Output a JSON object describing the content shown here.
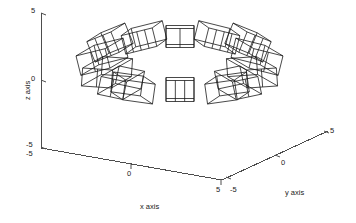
{
  "figure": {
    "type": "3d-line-plot",
    "background_color": "#ffffff",
    "line_color": "#1a1a1a",
    "axis_color": "#4d4d4d",
    "text_color": "#1a1a1a"
  },
  "axes": {
    "x": {
      "title": "x axis",
      "ticks": [
        "-5",
        "0",
        "5"
      ],
      "range": [
        -5,
        5
      ]
    },
    "y": {
      "title": "y axis",
      "ticks": [
        "-5",
        "0",
        "5"
      ],
      "range": [
        -5,
        5
      ]
    },
    "z": {
      "title": "z axis",
      "ticks": [
        "-5",
        "0",
        "5"
      ],
      "range": [
        -5,
        5
      ]
    }
  },
  "chart_data": {
    "type": "line",
    "title": "",
    "xlabel": "x axis",
    "ylabel": "y axis",
    "zlabel": "z axis",
    "xlim": [
      -5,
      5
    ],
    "ylim": [
      -5,
      5
    ],
    "zlim": [
      -5,
      5
    ],
    "grid": false,
    "legend": null,
    "series": [
      {
        "name": "wireframe-boxes",
        "count": 14,
        "boxes": [
          {
            "id": 1,
            "cluster": "left",
            "cx": 103,
            "cy": 47,
            "w": 26,
            "h": 22,
            "rot": -22,
            "skew": 14,
            "divisions": 2
          },
          {
            "id": 2,
            "cluster": "left",
            "cx": 93,
            "cy": 62,
            "w": 30,
            "h": 20,
            "rot": -14,
            "skew": 18,
            "divisions": 1
          },
          {
            "id": 3,
            "cluster": "left",
            "cx": 97,
            "cy": 78,
            "w": 30,
            "h": 18,
            "rot": 4,
            "skew": 20,
            "divisions": 1
          },
          {
            "id": 4,
            "cluster": "left",
            "cx": 112,
            "cy": 88,
            "w": 26,
            "h": 18,
            "rot": 12,
            "skew": 18,
            "divisions": 1
          },
          {
            "id": 5,
            "cluster": "left",
            "cx": 139,
            "cy": 41,
            "w": 32,
            "h": 19,
            "rot": -14,
            "skew": 10,
            "divisions": 3
          },
          {
            "id": 6,
            "cluster": "left",
            "cx": 139,
            "cy": 92,
            "w": 30,
            "h": 20,
            "rot": 8,
            "skew": -12,
            "divisions": 0
          },
          {
            "id": 7,
            "cluster": "center",
            "cx": 180,
            "cy": 38,
            "w": 28,
            "h": 19,
            "rot": 0,
            "skew": 0,
            "divisions": 1
          },
          {
            "id": 8,
            "cluster": "center",
            "cx": 180,
            "cy": 91,
            "w": 28,
            "h": 21,
            "rot": 0,
            "skew": 0,
            "divisions": 2
          },
          {
            "id": 9,
            "cluster": "right",
            "cx": 222,
            "cy": 41,
            "w": 32,
            "h": 19,
            "rot": 14,
            "skew": -10,
            "divisions": 3
          },
          {
            "id": 10,
            "cluster": "right",
            "cx": 255,
            "cy": 47,
            "w": 26,
            "h": 22,
            "rot": 22,
            "skew": -14,
            "divisions": 2
          },
          {
            "id": 11,
            "cluster": "right",
            "cx": 266,
            "cy": 62,
            "w": 30,
            "h": 20,
            "rot": 14,
            "skew": -18,
            "divisions": 1
          },
          {
            "id": 12,
            "cluster": "right",
            "cx": 262,
            "cy": 78,
            "w": 30,
            "h": 18,
            "rot": -4,
            "skew": -20,
            "divisions": 1
          },
          {
            "id": 13,
            "cluster": "right",
            "cx": 247,
            "cy": 88,
            "w": 26,
            "h": 18,
            "rot": -12,
            "skew": -18,
            "divisions": 1
          },
          {
            "id": 14,
            "cluster": "right",
            "cx": 221,
            "cy": 92,
            "w": 30,
            "h": 20,
            "rot": -8,
            "skew": 12,
            "divisions": 0
          }
        ]
      }
    ]
  }
}
